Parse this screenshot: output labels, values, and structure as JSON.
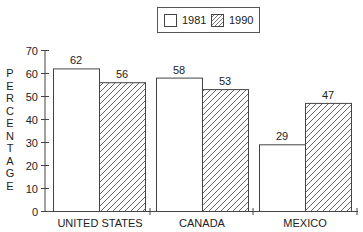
{
  "chart_data": {
    "type": "bar",
    "title": "",
    "xlabel": "",
    "ylabel": "PERCENTAGE",
    "ylim": [
      0,
      70
    ],
    "yticks": [
      0,
      10,
      20,
      30,
      40,
      50,
      60,
      70
    ],
    "categories": [
      "UNITED STATES",
      "CANADA",
      "MEXICO"
    ],
    "series": [
      {
        "name": "1981",
        "values": [
          62,
          58,
          29
        ],
        "fill": "white"
      },
      {
        "name": "1990",
        "values": [
          56,
          53,
          47
        ],
        "fill": "hatched"
      }
    ],
    "legend_position": "top",
    "grid": false,
    "data_labels": true
  },
  "legend": {
    "items": [
      {
        "label": "1981",
        "pattern": "plain"
      },
      {
        "label": "1990",
        "pattern": "diagonal-hatch"
      }
    ]
  },
  "axis": {
    "ylabel_letters": [
      "P",
      "E",
      "R",
      "C",
      "E",
      "N",
      "T",
      "A",
      "G",
      "E"
    ],
    "yticks": [
      "0",
      "10",
      "20",
      "30",
      "40",
      "50",
      "60",
      "70"
    ],
    "categories": [
      "UNITED STATES",
      "CANADA",
      "MEXICO"
    ]
  },
  "colors": {
    "line": "#444444",
    "text": "#222222",
    "background": "#ffffff"
  }
}
